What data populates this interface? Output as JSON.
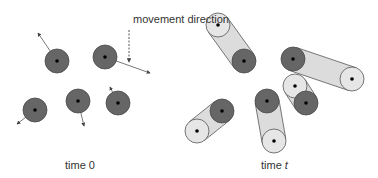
{
  "labels": {
    "callout": "movement direction",
    "time0": "time 0",
    "timet_prefix": "time ",
    "timet_var": "t"
  },
  "colors": {
    "particle_start": "#666666",
    "particle_end": "#e6e6e6",
    "trail": "#dcdcdc",
    "center_dot": "#000000"
  },
  "panel_time0": {
    "particle_radius": 12,
    "particles": [
      {
        "x": 57,
        "y": 61,
        "dir_to": [
          38,
          33
        ]
      },
      {
        "x": 105,
        "y": 57,
        "dir_to": [
          150,
          73
        ]
      },
      {
        "x": 35,
        "y": 110,
        "dir_to": [
          17,
          124
        ]
      },
      {
        "x": 78,
        "y": 101,
        "dir_to": [
          84,
          126
        ]
      },
      {
        "x": 118,
        "y": 103,
        "dir_to": [
          110,
          87
        ]
      }
    ],
    "callout_line": {
      "x": 129,
      "y1": 30,
      "y2": 62
    }
  },
  "panel_timet": {
    "particle_radius": 12,
    "particles": [
      {
        "start": [
          244,
          61
        ],
        "end": [
          218,
          25
        ]
      },
      {
        "start": [
          293,
          59
        ],
        "end": [
          352,
          79
        ]
      },
      {
        "start": [
          222,
          111
        ],
        "end": [
          197,
          131
        ]
      },
      {
        "start": [
          267,
          101
        ],
        "end": [
          274,
          141
        ]
      },
      {
        "start": [
          306,
          103
        ],
        "end": [
          295,
          86
        ]
      }
    ]
  }
}
